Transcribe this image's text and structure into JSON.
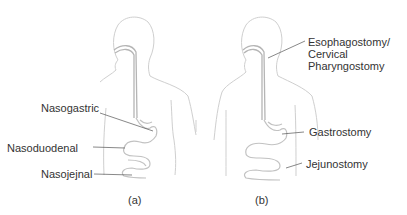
{
  "panels": [
    {
      "caption": "(a)",
      "labels": {
        "nasogastric": "Nasogastric",
        "nasoduodenal": "Nasoduodenal",
        "nasojejnal": "Nasojejnal"
      }
    },
    {
      "caption": "(b)",
      "labels": {
        "esophagostomy_line1": "Esophagostomy/",
        "esophagostomy_line2": "Cervical",
        "esophagostomy_line3": "Pharyngostomy",
        "gastrostomy": "Gastrostomy",
        "jejunostomy": "Jejunostomy"
      }
    }
  ],
  "colors": {
    "outline": "#c8c8c8",
    "tube": "#b0b0b0",
    "leader": "#555555",
    "text": "#333333"
  }
}
